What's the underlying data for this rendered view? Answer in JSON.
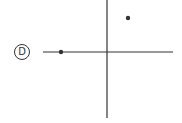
{
  "option_label": "D",
  "colors": {
    "stroke": "#333333",
    "background": "#ffffff"
  },
  "axes": {
    "horizontal": {
      "x1": 43,
      "x2": 173,
      "y": 52
    },
    "vertical": {
      "x": 107,
      "y1": 0,
      "y2": 118
    }
  },
  "points": [
    {
      "name": "point-left-on-x-axis",
      "cx": 61,
      "cy": 52
    },
    {
      "name": "point-upper-right",
      "cx": 128,
      "cy": 18
    }
  ]
}
